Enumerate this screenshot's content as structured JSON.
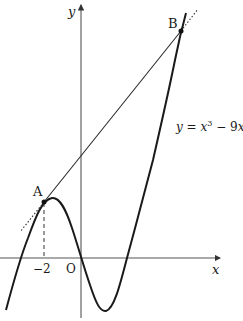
{
  "figure": {
    "function_label": "y = x³ − 9x",
    "function_label_parts": {
      "lhs": "y",
      "eq": " = ",
      "x": "x",
      "exp": "3",
      "rest": " − 9",
      "x2": "x"
    },
    "axis_labels": {
      "x": "x",
      "y": "y"
    },
    "origin_label": "O",
    "tick_labels": {
      "minus_two": "−2"
    },
    "points": [
      {
        "name": "A",
        "label": "A",
        "x": -2,
        "y": 10
      },
      {
        "name": "B",
        "label": "B",
        "x": 4,
        "y": 28
      }
    ],
    "colors": {
      "curve": "#1a1a1a",
      "axes": "#555555",
      "line": "#2a2a2a"
    }
  }
}
